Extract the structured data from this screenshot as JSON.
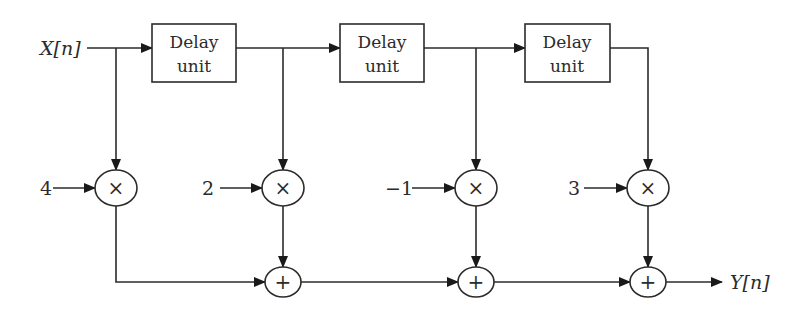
{
  "diagram": {
    "type": "FIR filter block diagram",
    "input": {
      "label": "X[n]"
    },
    "output": {
      "label": "Y[n]"
    },
    "delay_units": [
      {
        "line1": "Delay",
        "line2": "unit"
      },
      {
        "line1": "Delay",
        "line2": "unit"
      },
      {
        "line1": "Delay",
        "line2": "unit"
      }
    ],
    "multipliers": [
      {
        "coefficient": "4",
        "symbol": "×"
      },
      {
        "coefficient": "2",
        "symbol": "×"
      },
      {
        "coefficient": "−1",
        "symbol": "×"
      },
      {
        "coefficient": "3",
        "symbol": "×"
      }
    ],
    "adders": [
      {
        "symbol": "+"
      },
      {
        "symbol": "+"
      },
      {
        "symbol": "+"
      }
    ],
    "colors": {
      "stroke": "#2b2b2b",
      "background": "#ffffff"
    }
  }
}
